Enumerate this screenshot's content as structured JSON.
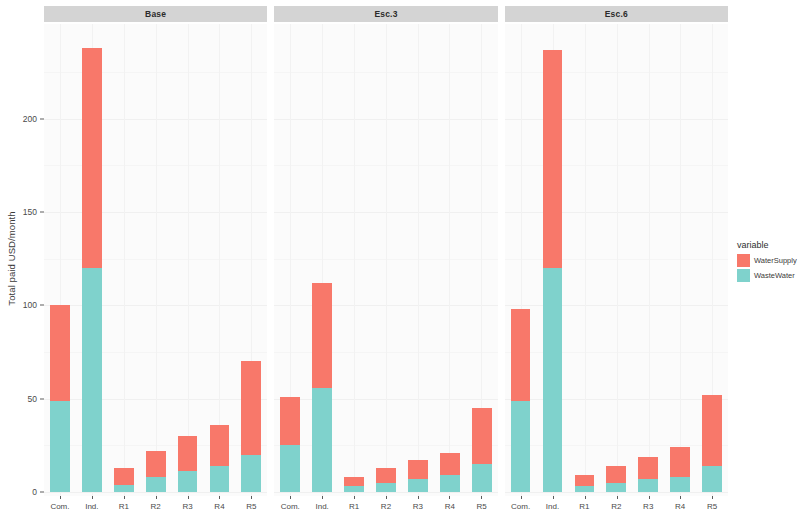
{
  "chart_data": {
    "type": "bar",
    "subtype": "stacked-bar-faceted",
    "title": "",
    "xlabel": "",
    "ylabel": "Total paid USD/month",
    "ylim": [
      0,
      245
    ],
    "y_ticks": [
      0,
      50,
      100,
      150,
      200
    ],
    "y_tick_labels": [
      "0",
      "50",
      "100",
      "150",
      "200"
    ],
    "grid": true,
    "legend": {
      "title": "variable",
      "position": "right",
      "entries": [
        {
          "name": "WaterSupply",
          "color": "#f8786a"
        },
        {
          "name": "WasteWater",
          "color": "#7fd2cc"
        }
      ]
    },
    "categories": [
      "Com.",
      "Ind.",
      "R1",
      "R2",
      "R3",
      "R4",
      "R5"
    ],
    "facets": [
      {
        "label": "Base",
        "series": [
          {
            "name": "WasteWater",
            "values": [
              49,
              120,
              4,
              8,
              11,
              14,
              20
            ]
          },
          {
            "name": "WaterSupply",
            "values": [
              51,
              118,
              9,
              14,
              19,
              22,
              50
            ]
          }
        ],
        "totals": [
          100,
          238,
          13,
          22,
          30,
          36,
          70
        ]
      },
      {
        "label": "Esc.3",
        "series": [
          {
            "name": "WasteWater",
            "values": [
              25,
              56,
              3,
              5,
              7,
              9,
              15
            ]
          },
          {
            "name": "WaterSupply",
            "values": [
              26,
              56,
              5,
              8,
              10,
              12,
              30
            ]
          }
        ],
        "totals": [
          51,
          112,
          8,
          13,
          17,
          21,
          45
        ]
      },
      {
        "label": "Esc.6",
        "series": [
          {
            "name": "WasteWater",
            "values": [
              49,
              120,
              3,
              5,
              7,
              8,
              14
            ]
          },
          {
            "name": "WaterSupply",
            "values": [
              49,
              117,
              6,
              9,
              12,
              16,
              38
            ]
          }
        ],
        "totals": [
          98,
          237,
          9,
          14,
          19,
          24,
          52
        ]
      }
    ]
  },
  "colors": {
    "water_supply": "#f8786a",
    "waste_water": "#7fd2cc",
    "panel_background": "#fbfbfb",
    "strip_background": "#d4d4d4",
    "page_background": "#ffffff"
  }
}
